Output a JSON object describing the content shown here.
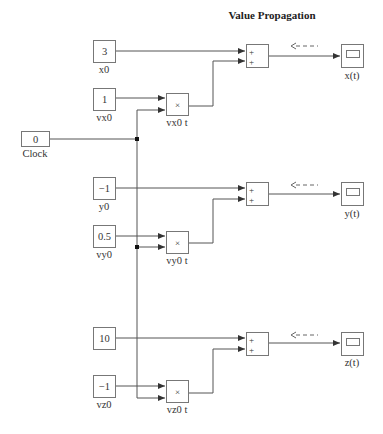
{
  "title": "Value Propagation",
  "clock": {
    "value": "0",
    "label": "Clock"
  },
  "rows": [
    {
      "const": {
        "value": "3",
        "label": "x0"
      },
      "velocity": {
        "value": "1",
        "label": "vx0"
      },
      "product": {
        "symbol": "×",
        "label": "vx0 t"
      },
      "sum": {
        "signs": [
          "+",
          "+"
        ]
      },
      "scope": {
        "label": "x(t)"
      }
    },
    {
      "const": {
        "value": "−1",
        "label": "y0"
      },
      "velocity": {
        "value": "0.5",
        "label": "vy0"
      },
      "product": {
        "symbol": "×",
        "label": "vy0 t"
      },
      "sum": {
        "signs": [
          "+",
          "+"
        ]
      },
      "scope": {
        "label": "y(t)"
      }
    },
    {
      "const": {
        "value": "10",
        "label": ""
      },
      "velocity": {
        "value": "−1",
        "label": "vz0"
      },
      "product": {
        "symbol": "×",
        "label": "vz0 t"
      },
      "sum": {
        "signs": [
          "+",
          "+"
        ]
      },
      "scope": {
        "label": "z(t)"
      }
    }
  ],
  "colors": {
    "line": "#555555",
    "box_border": "#777777"
  }
}
